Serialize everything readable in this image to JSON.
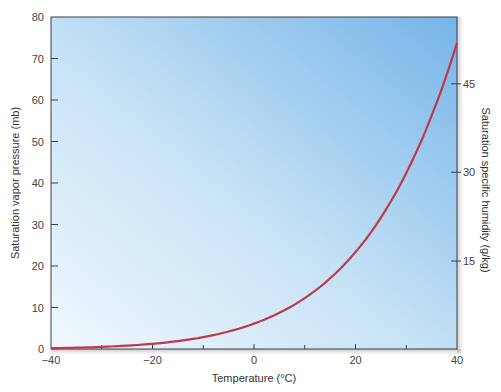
{
  "chart_data": {
    "type": "line",
    "title": "",
    "xlabel": "Temperature (°C)",
    "ylabel": "Saturation vapor pressure (mb)",
    "y2label": "Saturation specific humidity (g/kg)",
    "xlim": [
      -40,
      40
    ],
    "ylim": [
      0,
      80
    ],
    "x_ticks": [
      -40,
      -20,
      0,
      20,
      40
    ],
    "x_minor_ticks": [
      -30,
      -10,
      10,
      30
    ],
    "y_ticks": [
      0,
      10,
      20,
      30,
      40,
      50,
      60,
      70,
      80
    ],
    "y2_ticks": [
      {
        "label": "15",
        "y_equiv_mb": 21.2
      },
      {
        "label": "30",
        "y_equiv_mb": 42.6
      },
      {
        "label": "45",
        "y_equiv_mb": 63.9
      }
    ],
    "grid": false,
    "legend": null,
    "series": [
      {
        "name": "Saturation vapor pressure",
        "color": "#c0394b",
        "x": [
          -40,
          -35,
          -30,
          -25,
          -20,
          -15,
          -10,
          -5,
          0,
          5,
          10,
          15,
          20,
          25,
          30,
          35,
          40
        ],
        "values": [
          0.19,
          0.31,
          0.51,
          0.81,
          1.25,
          1.91,
          2.86,
          4.22,
          6.11,
          8.72,
          12.27,
          17.04,
          23.37,
          31.67,
          42.43,
          56.24,
          73.75
        ]
      }
    ],
    "background_gradient": {
      "from": "#eef7fc",
      "to": "#7ab8ea"
    }
  },
  "axes": {
    "x_title": "Temperature (°C)",
    "y_left_title": "Saturation vapor pressure (mb)",
    "y_right_title": "Saturation specific humidity (g/kg)",
    "x_tick_labels": [
      "−40",
      "−20",
      "0",
      "20",
      "40"
    ],
    "y_left_tick_labels": [
      "0",
      "10",
      "20",
      "30",
      "40",
      "50",
      "60",
      "70",
      "80"
    ],
    "y_right_tick_labels": [
      "15",
      "30",
      "45"
    ]
  }
}
